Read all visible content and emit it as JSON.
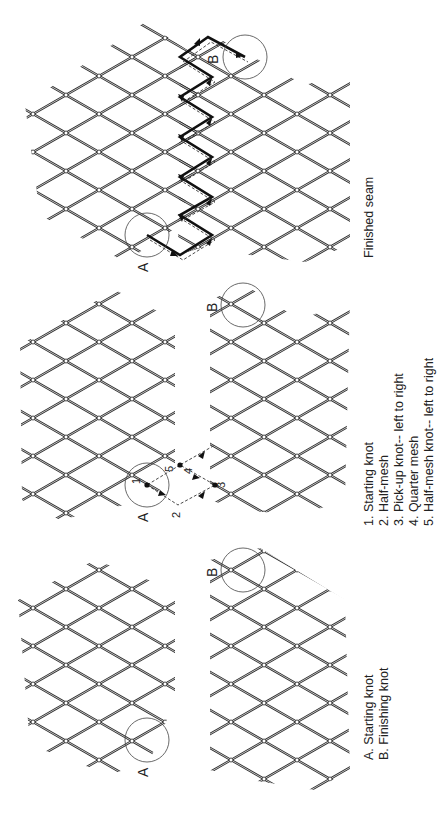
{
  "figures": [
    {
      "id": "finished-seam",
      "caption": "Finished seam",
      "markers": {
        "a": "A",
        "b": "B"
      }
    },
    {
      "id": "seam-steps",
      "markers": {
        "a": "A",
        "b": "B"
      },
      "step_numbers": [
        "1",
        "2",
        "3",
        "4",
        "5"
      ],
      "legend": [
        "1. Starting knot",
        "2. Half-mesh",
        "3. Pick-up knot-- left to  right",
        "4. Quarter mesh",
        "5. Half-mesh knot-- left to  right"
      ]
    },
    {
      "id": "panels-before-joining",
      "markers": {
        "a": "A",
        "b": "B"
      },
      "legend": [
        "A. Starting knot",
        "B. Finishing knot"
      ]
    }
  ],
  "colors": {
    "background": "#ffffff",
    "twine": "#2a2a2a",
    "text": "#222222"
  }
}
